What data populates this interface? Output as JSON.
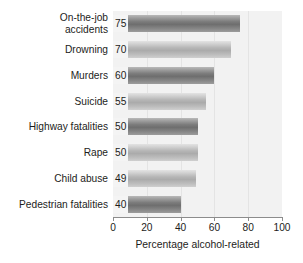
{
  "chart_data": {
    "type": "bar",
    "orientation": "horizontal",
    "title": "",
    "xlabel": "Percentage alcohol-related",
    "ylabel": "",
    "xlim": [
      0,
      100
    ],
    "grid": true,
    "legend": null,
    "categories": [
      "On-the-job accidents",
      "Drowning",
      "Murders",
      "Suicide",
      "Highway fatalities",
      "Rape",
      "Child abuse",
      "Pedestrian fatalities"
    ],
    "values": [
      75,
      70,
      60,
      55,
      50,
      50,
      49,
      40
    ],
    "data_labels": [
      "75",
      "70",
      "60",
      "55",
      "50",
      "50",
      "49",
      "40"
    ],
    "xticks": [
      0,
      20,
      40,
      60,
      80,
      100
    ],
    "xtick_labels": [
      "0",
      "20",
      "40",
      "60",
      "80",
      "100"
    ],
    "bar_shades": [
      "dark",
      "light",
      "dark",
      "light",
      "dark",
      "light",
      "light",
      "dark"
    ],
    "colors": {
      "plot_background": "#f2f2f2",
      "gridline": "#e4e4e4",
      "axis": "#8c8c8c",
      "text": "#1d1d1b",
      "bar_dark": "#6e6e6e",
      "bar_light": "#ababab",
      "value_label_background": "#f4f4f4"
    }
  }
}
